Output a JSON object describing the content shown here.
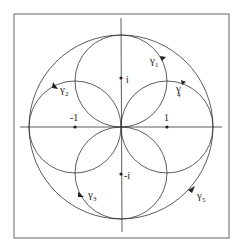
{
  "diagram": {
    "type": "complex-plane contour diagram",
    "frame": {
      "x": 14,
      "y": 14,
      "w": 215,
      "h": 224
    },
    "origin": {
      "x": 121,
      "y": 127
    },
    "unit_px": 46,
    "axes": {
      "horizontal": true,
      "vertical": true
    },
    "big_circle": {
      "radius_units": 2
    },
    "small_circles": [
      {
        "center": "i",
        "radius_units": 1
      },
      {
        "center": "-i",
        "radius_units": 1
      },
      {
        "center": "1",
        "radius_units": 1
      },
      {
        "center": "-1",
        "radius_units": 1
      }
    ],
    "points": [
      {
        "label": "i",
        "re": 0,
        "im": 1
      },
      {
        "label": "-i",
        "re": 0,
        "im": -1
      },
      {
        "label": "1",
        "re": 1,
        "im": 0
      },
      {
        "label": "-1",
        "re": -1,
        "im": 0
      }
    ],
    "curves": [
      {
        "label": "γ",
        "sub": "1"
      },
      {
        "label": "γ",
        "sub": "2"
      },
      {
        "label": "γ",
        "sub": "3"
      },
      {
        "label": "γ",
        "sub": "4"
      },
      {
        "label": "γ",
        "sub": "5"
      }
    ],
    "colors": {
      "stroke": "#333333",
      "frame": "#555555",
      "background": "#ffffff"
    }
  }
}
